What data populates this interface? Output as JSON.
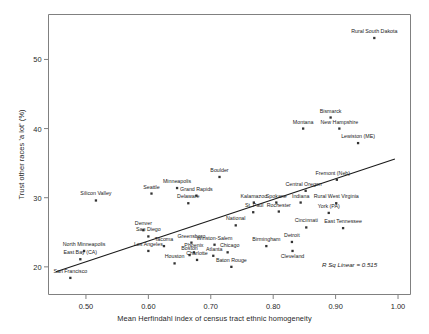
{
  "chart_data": {
    "type": "scatter",
    "title": "",
    "xlabel": "Mean Herfindahl index of census tract ethnic homogeneity",
    "ylabel": "Trust other races 'a lot' (%)",
    "xlim": [
      0.44,
      1.02
    ],
    "ylim": [
      16.0,
      56.5
    ],
    "xticks": [
      "0.50",
      "0.60",
      "0.70",
      "0.80",
      "0.90",
      "1.00"
    ],
    "xtick_values": [
      0.5,
      0.6,
      0.7,
      0.8,
      0.9,
      1.0
    ],
    "yticks": [
      "20",
      "30",
      "40",
      "50"
    ],
    "ytick_values": [
      20,
      30,
      40,
      50
    ],
    "grid": false,
    "legend": false,
    "annotation": "R Sq Linear = 0.515",
    "fit_line": {
      "type": "linear",
      "x_start": 0.452,
      "y_start": 19.3,
      "x_end": 0.995,
      "y_end": 35.6
    },
    "marker_color": "#333333",
    "axis_color": "#808080",
    "points": [
      {
        "label": "Rural South Dakota",
        "x": 0.962,
        "y": 53.1,
        "label_dx": 0,
        "label_dy": -5
      },
      {
        "label": "Bismarck",
        "x": 0.892,
        "y": 41.6,
        "label_dx": 0,
        "label_dy": -5
      },
      {
        "label": "Montana",
        "x": 0.848,
        "y": 40.0,
        "label_dx": 0,
        "label_dy": -5
      },
      {
        "label": "New Hampshire",
        "x": 0.906,
        "y": 40.0,
        "label_dx": 0,
        "label_dy": -5
      },
      {
        "label": "Lewiston (ME)",
        "x": 0.936,
        "y": 37.9,
        "label_dx": 0,
        "label_dy": -5
      },
      {
        "label": "Boulder",
        "x": 0.714,
        "y": 33.0,
        "label_dx": 0,
        "label_dy": -5
      },
      {
        "label": "Fremont (Neb)",
        "x": 0.902,
        "y": 32.6,
        "label_dx": -4,
        "label_dy": -5
      },
      {
        "label": "Central Oregon",
        "x": 0.852,
        "y": 31.0,
        "label_dx": -2,
        "label_dy": -5
      },
      {
        "label": "Seattle",
        "x": 0.605,
        "y": 30.6,
        "label_dx": 0,
        "label_dy": -5
      },
      {
        "label": "Minneapolis",
        "x": 0.646,
        "y": 31.4,
        "label_dx": 0,
        "label_dy": -5
      },
      {
        "label": "Grand Rapids",
        "x": 0.677,
        "y": 30.3,
        "label_dx": 0,
        "label_dy": -5
      },
      {
        "label": "Delaware",
        "x": 0.664,
        "y": 29.2,
        "label_dx": 0,
        "label_dy": -5
      },
      {
        "label": "Silicon Valley",
        "x": 0.516,
        "y": 29.6,
        "label_dx": 0,
        "label_dy": -5
      },
      {
        "label": "Kalamazoo",
        "x": 0.769,
        "y": 29.3,
        "label_dx": 0,
        "label_dy": -5
      },
      {
        "label": "Spokane",
        "x": 0.805,
        "y": 29.3,
        "label_dx": 0,
        "label_dy": -5
      },
      {
        "label": "Indiana",
        "x": 0.844,
        "y": 29.3,
        "label_dx": 0,
        "label_dy": -5
      },
      {
        "label": "Rural West Virginia",
        "x": 0.901,
        "y": 29.2,
        "label_dx": 0,
        "label_dy": -5
      },
      {
        "label": "St. Paul",
        "x": 0.768,
        "y": 27.9,
        "label_dx": 1,
        "label_dy": -5
      },
      {
        "label": "Rochester",
        "x": 0.809,
        "y": 28.0,
        "label_dx": 0,
        "label_dy": -5
      },
      {
        "label": "York (PA)",
        "x": 0.889,
        "y": 27.8,
        "label_dx": 0,
        "label_dy": -5
      },
      {
        "label": "Cincinnati",
        "x": 0.853,
        "y": 25.7,
        "label_dx": 0,
        "label_dy": -5
      },
      {
        "label": "East Tennessee",
        "x": 0.912,
        "y": 25.6,
        "label_dx": 0,
        "label_dy": -5
      },
      {
        "label": "National",
        "x": 0.74,
        "y": 26.0,
        "label_dx": 0,
        "label_dy": -5
      },
      {
        "label": "Denver",
        "x": 0.592,
        "y": 25.3,
        "label_dx": 0,
        "label_dy": -5
      },
      {
        "label": "San Diego",
        "x": 0.6,
        "y": 24.4,
        "label_dx": 0,
        "label_dy": -5
      },
      {
        "label": "Detroit",
        "x": 0.83,
        "y": 23.6,
        "label_dx": 0,
        "label_dy": -5
      },
      {
        "label": "Cleveland",
        "x": 0.831,
        "y": 22.3,
        "label_dx": 0,
        "label_dy": 7
      },
      {
        "label": "Birmingham",
        "x": 0.789,
        "y": 23.0,
        "label_dx": 0,
        "label_dy": -5
      },
      {
        "label": "Greensboro",
        "x": 0.669,
        "y": 23.5,
        "label_dx": 0,
        "label_dy": -5
      },
      {
        "label": "Winston-Salem",
        "x": 0.706,
        "y": 23.2,
        "label_dx": 0,
        "label_dy": -5
      },
      {
        "label": "Tacoma",
        "x": 0.625,
        "y": 23.0,
        "label_dx": 0,
        "label_dy": -5
      },
      {
        "label": "North Minneapolis",
        "x": 0.497,
        "y": 22.3,
        "label_dx": 0,
        "label_dy": -5
      },
      {
        "label": "Los Angeles",
        "x": 0.6,
        "y": 22.3,
        "label_dx": 0,
        "label_dy": -5
      },
      {
        "label": "Boston",
        "x": 0.666,
        "y": 21.7,
        "label_dx": 0,
        "label_dy": -5
      },
      {
        "label": "East Bay (CA)",
        "x": 0.491,
        "y": 21.1,
        "label_dx": 0,
        "label_dy": -5
      },
      {
        "label": "Phoenix",
        "x": 0.673,
        "y": 22.1,
        "label_dx": 0,
        "label_dy": -5
      },
      {
        "label": "Chicago",
        "x": 0.727,
        "y": 22.1,
        "label_dx": 2,
        "label_dy": -5
      },
      {
        "label": "Atlanta",
        "x": 0.704,
        "y": 21.6,
        "label_dx": 1,
        "label_dy": -5
      },
      {
        "label": "Charlotte",
        "x": 0.678,
        "y": 21.0,
        "label_dx": 0,
        "label_dy": -5
      },
      {
        "label": "Houston",
        "x": 0.642,
        "y": 20.5,
        "label_dx": 0,
        "label_dy": -5
      },
      {
        "label": "Baton Rouge",
        "x": 0.733,
        "y": 20.0,
        "label_dx": 0,
        "label_dy": -5
      },
      {
        "label": "San Francisco",
        "x": 0.475,
        "y": 18.4,
        "label_dx": 0,
        "label_dy": -5
      }
    ]
  }
}
